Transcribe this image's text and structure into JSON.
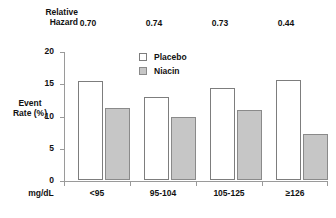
{
  "chart_data": {
    "type": "bar",
    "title": "",
    "xlabel": "mg/dL",
    "ylabel": "Event Rate (%)",
    "categories": [
      "<95",
      "95-104",
      "105-125",
      "≥126"
    ],
    "series": [
      {
        "name": "Placebo",
        "values": [
          15.4,
          12.9,
          14.3,
          15.5
        ],
        "color": "#ffffff"
      },
      {
        "name": "Niacin",
        "values": [
          11.1,
          9.8,
          10.8,
          7.2
        ],
        "color": "#c6c6c6"
      }
    ],
    "ylim": [
      0,
      20
    ],
    "yticks": [
      "0",
      "5",
      "10",
      "15",
      "20"
    ],
    "grid": false,
    "legend_position": "top-center",
    "annotations": {
      "row_label": "Relative\nHazard",
      "row_values": [
        "0.70",
        "0.74",
        "0.73",
        "0.44"
      ]
    }
  },
  "header": {
    "relative_label_line1": "Relative",
    "relative_label_line2": "Hazard",
    "hazard_values": [
      "0.70",
      "0.74",
      "0.73",
      "0.44"
    ]
  },
  "axes": {
    "y_title_line1": "Event",
    "y_title_line2": "Rate (%)",
    "y_ticks": [
      "20",
      "15",
      "10",
      "5",
      "0"
    ],
    "x_unit": "mg/dL",
    "x_categories": [
      "<95",
      "95-104",
      "105-125",
      "≥126"
    ]
  },
  "legend": {
    "items": [
      {
        "label": "Placebo",
        "type": "open"
      },
      {
        "label": "Niacin",
        "type": "filled"
      }
    ]
  }
}
